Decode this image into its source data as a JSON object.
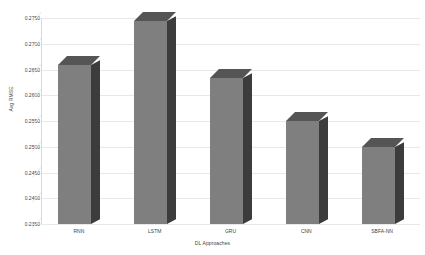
{
  "chart_data": {
    "type": "bar",
    "title": "",
    "categories": [
      "RNN",
      "LSTM",
      "GRU",
      "CNN",
      "SBFA-NN"
    ],
    "values": [
      0.2658,
      0.2744,
      0.2633,
      0.255,
      0.25
    ],
    "series": [
      {
        "name": "Avg RMSE",
        "values": [
          0.2658,
          0.2744,
          0.2633,
          0.255,
          0.25
        ]
      }
    ],
    "xlabel": "DL Approaches",
    "ylabel": "Avg RMSE",
    "ylim": [
      0.235,
      0.275
    ],
    "ytick_labels": [
      "0.2750",
      "0.2700",
      "0.2650",
      "0.2600",
      "0.2550",
      "0.2500",
      "0.2450",
      "0.2400",
      "0.2350"
    ],
    "ytick_values": [
      0.275,
      0.27,
      0.265,
      0.26,
      0.255,
      0.25,
      0.245,
      0.24,
      0.235
    ],
    "grid": true,
    "legend": "none",
    "style": "3d-column",
    "bar_color": "#7f7f7f",
    "bar_side_color": "#3c3c3c",
    "bar_top_color": "#555555",
    "gridline_color": "#e8e8ea",
    "text_color": "#3f3f3f",
    "background": "#ffffff"
  }
}
